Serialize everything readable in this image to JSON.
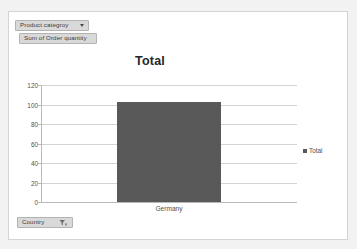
{
  "report": {
    "category_field": {
      "label": "Product categroy",
      "icon": "chevron-down-icon"
    },
    "measure_field": {
      "label": "Sum of Order quantity"
    },
    "country_field": {
      "label": "Country",
      "icon": "filter-icon"
    }
  },
  "chart_data": {
    "type": "bar",
    "title": "Total",
    "categories": [
      "Germany"
    ],
    "series": [
      {
        "name": "Total",
        "values": [
          103
        ]
      }
    ],
    "values": [
      103
    ],
    "xlabel": "",
    "ylabel": "",
    "ylim": [
      0,
      120
    ],
    "yticks": [
      0,
      20,
      40,
      60,
      80,
      100,
      120
    ],
    "ytick_labels": [
      "0",
      "20",
      "40",
      "60",
      "80",
      "100",
      "120"
    ],
    "grid": true,
    "legend": {
      "position": "right",
      "entries": [
        "Total"
      ]
    },
    "bar_color": "#595959",
    "gridline_color": "#d3d3d3"
  }
}
